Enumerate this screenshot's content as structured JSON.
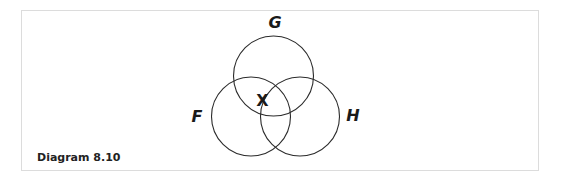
{
  "caption": "Diagram 8.10",
  "sets": [
    {
      "label": "G",
      "cx": 273.5,
      "cy": 76,
      "r": 40
    },
    {
      "label": "F",
      "cx": 251,
      "cy": 116.5,
      "r": 39.5
    },
    {
      "label": "H",
      "cx": 300,
      "cy": 116.5,
      "r": 39.5
    }
  ],
  "labels": {
    "G": {
      "text": "G",
      "x": 275,
      "y": 28
    },
    "F": {
      "text": "F",
      "x": 197,
      "y": 122
    },
    "H": {
      "text": "H",
      "x": 353,
      "y": 121
    },
    "X": {
      "text": "X",
      "x": 262.5,
      "y": 106
    }
  },
  "colors": {
    "stroke": "#2b2b2b",
    "border": "#dcdcdc",
    "text": "#1a1a1a"
  }
}
